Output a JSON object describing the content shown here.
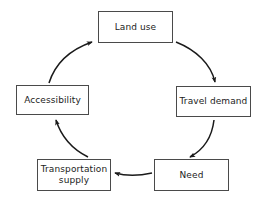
{
  "diagram": {
    "type": "cycle-diagram",
    "background_color": "#ffffff",
    "box_border_color": "#4a4a4a",
    "arrow_color": "#1a1a1a",
    "text_color": "#1c1c1c",
    "nodes": [
      {
        "id": "land-use",
        "label": "Land use",
        "x": 98,
        "y": 11,
        "width": 75,
        "height": 32
      },
      {
        "id": "travel-demand",
        "label": "Travel demand",
        "x": 176,
        "y": 86,
        "width": 75,
        "height": 31
      },
      {
        "id": "need",
        "label": "Need",
        "x": 154,
        "y": 159,
        "width": 75,
        "height": 32
      },
      {
        "id": "transportation-supply",
        "label": "Transportation\nsupply",
        "x": 37,
        "y": 159,
        "width": 74,
        "height": 32
      },
      {
        "id": "accessibility",
        "label": "Accessibility",
        "x": 16,
        "y": 85,
        "width": 73,
        "height": 30
      }
    ],
    "arrows": [
      {
        "id": "land-use-to-travel-demand",
        "from": "land-use",
        "to": "travel-demand",
        "direction": "clockwise-down-right"
      },
      {
        "id": "travel-demand-to-need",
        "from": "travel-demand",
        "to": "need",
        "direction": "clockwise-down-left"
      },
      {
        "id": "need-to-transportation-supply",
        "from": "need",
        "to": "transportation-supply",
        "direction": "left"
      },
      {
        "id": "transportation-supply-to-accessibility",
        "from": "transportation-supply",
        "to": "accessibility",
        "direction": "clockwise-up-left"
      },
      {
        "id": "accessibility-to-land-use",
        "from": "accessibility",
        "to": "land-use",
        "direction": "clockwise-up-right"
      }
    ]
  }
}
